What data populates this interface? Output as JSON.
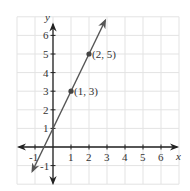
{
  "chart_data": {
    "type": "line",
    "title": "",
    "xlabel": "x",
    "ylabel": "y",
    "xlim": [
      -2,
      7
    ],
    "ylim": [
      -2,
      7
    ],
    "grid": true,
    "x_ticks": [
      "-1",
      "1",
      "2",
      "3",
      "4",
      "5",
      "6"
    ],
    "y_ticks": [
      "6",
      "5",
      "4",
      "3",
      "2",
      "1",
      "-1"
    ],
    "series": [
      {
        "name": "y = 2x + 1",
        "slope": 2,
        "intercept": 1,
        "line_extent_x": [
          -1.15,
          2.9
        ],
        "points": [
          {
            "x": 1,
            "y": 3,
            "label": "(1, 3)"
          },
          {
            "x": 2,
            "y": 5,
            "label": "(2, 5)"
          }
        ]
      }
    ],
    "colors": {
      "axis": "#222222",
      "line": "#555555",
      "grid": "#e3e3e3"
    }
  }
}
